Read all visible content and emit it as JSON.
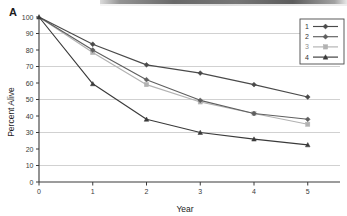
{
  "panel": {
    "label": "A"
  },
  "chart_data": {
    "type": "line",
    "title": "",
    "xlabel": "Year",
    "ylabel": "Percent Alive",
    "x": [
      0,
      1,
      2,
      3,
      4,
      5
    ],
    "xlim": [
      0,
      5.6
    ],
    "ylim": [
      0,
      100
    ],
    "xticks": [
      "0",
      "1",
      "2",
      "3",
      "4",
      "5"
    ],
    "yticks": [
      "0",
      "10",
      "20",
      "30",
      "40",
      "50",
      "60",
      "70",
      "80",
      "90",
      "100"
    ],
    "gridlines": [
      10,
      30,
      50,
      70,
      90
    ],
    "grid": true,
    "legend_position": "top-right",
    "series": [
      {
        "name": "1",
        "label": "1",
        "color": "#4a4a4a",
        "marker": "diamond",
        "values": [
          100,
          83.5,
          71,
          66,
          59,
          51.5
        ]
      },
      {
        "name": "2",
        "label": "2",
        "color": "#5f5f5f",
        "marker": "diamond",
        "values": [
          100,
          80,
          62,
          49.5,
          41.5,
          38
        ]
      },
      {
        "name": "3",
        "label": "3",
        "color": "#b2b2b2",
        "marker": "square",
        "values": [
          100,
          78.5,
          59,
          48.5,
          41.5,
          35
        ]
      },
      {
        "name": "4",
        "label": "4",
        "color": "#3a3a3a",
        "marker": "triangle",
        "values": [
          100,
          59.5,
          38,
          30,
          26,
          22.5
        ]
      }
    ]
  },
  "legend": {
    "entries": [
      "1",
      "2",
      "3",
      "4"
    ]
  }
}
